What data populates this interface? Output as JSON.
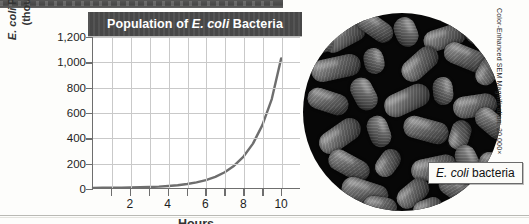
{
  "figure": {
    "top_band_note": "",
    "photo": {
      "caption_italic": "E. coli",
      "caption_rest": " bacteria",
      "credit": "Color-Enhanced SEM  Magnification: 20,000×"
    }
  },
  "chart_data": {
    "type": "line",
    "title_prefix": "Population of ",
    "title_italic": "E. coli",
    "title_suffix": " Bacteria",
    "title": "Population of E. coli Bacteria",
    "xlabel": "Hours",
    "ylabel_line1_italic": "E. coli",
    "ylabel_line1_rest": " Population",
    "ylabel_line2": "(thousands)",
    "ylabel": "E. coli Population (thousands)",
    "xlim": [
      0,
      11
    ],
    "ylim": [
      0,
      1200
    ],
    "xticks": [
      2,
      4,
      6,
      8,
      10
    ],
    "xtick_labels": [
      "2",
      "4",
      "6",
      "8",
      "10"
    ],
    "yticks": [
      0,
      200,
      400,
      600,
      800,
      1000,
      1200
    ],
    "ytick_labels": [
      "0",
      "200",
      "400",
      "600",
      "800",
      "1,000",
      "1,200"
    ],
    "grid": true,
    "legend": false,
    "series": [
      {
        "name": "E. coli population",
        "color": "#6e6e6e",
        "x": [
          0,
          0.5,
          1,
          1.5,
          2,
          2.5,
          3,
          3.5,
          4,
          4.5,
          5,
          5.5,
          6,
          6.5,
          7,
          7.5,
          8,
          8.5,
          9,
          9.5,
          10
        ],
        "values": [
          1,
          1.4,
          2,
          2.8,
          4,
          5.6,
          8,
          11,
          16,
          22,
          32,
          45,
          63,
          89,
          125,
          177,
          250,
          353,
          500,
          707,
          1030
        ]
      }
    ]
  }
}
